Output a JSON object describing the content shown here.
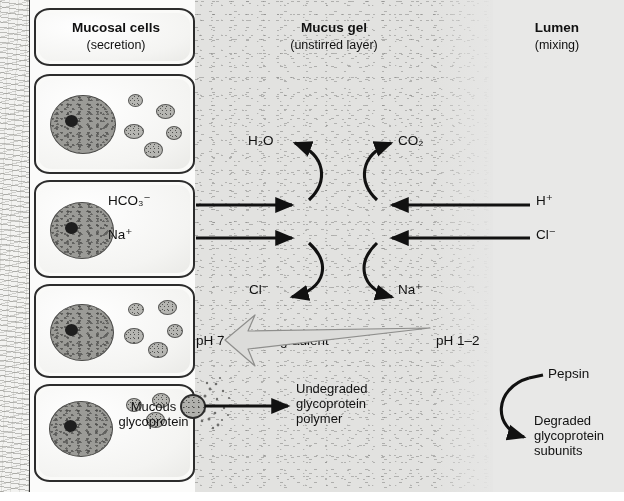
{
  "panels": {
    "cells": {
      "heading": "Mucosal cells",
      "subheading": "(secretion)"
    },
    "mucus": {
      "heading": "Mucus gel",
      "subheading": "(unstirred layer)"
    },
    "lumen": {
      "heading": "Lumen",
      "subheading": "(mixing)"
    }
  },
  "species": {
    "water": "H₂O",
    "carbon_dioxide": "CO₂",
    "bicarbonate": "HCO₃⁻",
    "sodium": "Na⁺",
    "chloride": "Cl⁻",
    "proton": "H⁺",
    "chloride_out": "Cl⁻",
    "sodium_out": "Na⁺"
  },
  "ph": {
    "mucosal_side": "pH 7",
    "gradient_label": "pH gradient",
    "lumen_side": "pH 1–2"
  },
  "glycoprotein": {
    "source_label_line1": "Mucous",
    "source_label_line2": "glycoprotein",
    "undegraded_line1": "Undegraded",
    "undegraded_line2": "glycoprotein",
    "undegraded_line3": "polymer",
    "enzyme": "Pepsin",
    "degraded_line1": "Degraded",
    "degraded_line2": "glycoprotein",
    "degraded_line3": "subunits"
  },
  "colors": {
    "ink": "#111111",
    "cell_fill": "#fafaf8",
    "mucus_fill": "#e2e2e0",
    "lumen_fill": "#e8e8e7",
    "tissue_fill": "#f3f3f1",
    "nucleus_fill": "#9b9b97",
    "ph_arrow_fill": "#dcdcda"
  }
}
